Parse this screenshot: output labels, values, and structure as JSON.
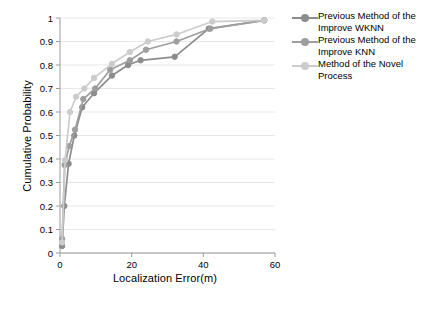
{
  "chart_data": {
    "type": "line",
    "title": "",
    "xlabel": "Localization Error(m)",
    "ylabel": "Cumulative Probability",
    "xlim": [
      0,
      60
    ],
    "ylim": [
      0,
      1
    ],
    "xticks": [
      0,
      20,
      40,
      60
    ],
    "yticks": [
      0,
      0.1,
      0.2,
      0.3,
      0.4,
      0.5,
      0.6,
      0.7,
      0.8,
      0.9,
      1
    ],
    "xtick_labels": [
      "0",
      "20",
      "40",
      "60"
    ],
    "ytick_labels": [
      "0",
      "0.1",
      "0.2",
      "0.3",
      "0.4",
      "0.5",
      "0.6",
      "0.7",
      "0.8",
      "0.9",
      "1"
    ],
    "grid": false,
    "legend_position": "right",
    "series": [
      {
        "name": "Previous Method of the Improve WKNN",
        "color": "#8c8c8c",
        "marker": "circle",
        "points": [
          {
            "x": 0.6,
            "y": 0.03
          },
          {
            "x": 1.2,
            "y": 0.2
          },
          {
            "x": 2.4,
            "y": 0.38
          },
          {
            "x": 4.0,
            "y": 0.5
          },
          {
            "x": 6.2,
            "y": 0.62
          },
          {
            "x": 9.5,
            "y": 0.68
          },
          {
            "x": 14.5,
            "y": 0.755
          },
          {
            "x": 19.0,
            "y": 0.8
          },
          {
            "x": 22.5,
            "y": 0.82
          },
          {
            "x": 32.0,
            "y": 0.835
          },
          {
            "x": 41.5,
            "y": 0.955
          },
          {
            "x": 57.0,
            "y": 0.99
          }
        ]
      },
      {
        "name": "Previous Method of the Improve KNN",
        "color": "#9e9e9e",
        "marker": "circle",
        "points": [
          {
            "x": 0.6,
            "y": 0.06
          },
          {
            "x": 1.3,
            "y": 0.375
          },
          {
            "x": 2.6,
            "y": 0.455
          },
          {
            "x": 4.2,
            "y": 0.525
          },
          {
            "x": 6.5,
            "y": 0.655
          },
          {
            "x": 9.8,
            "y": 0.7
          },
          {
            "x": 14.0,
            "y": 0.78
          },
          {
            "x": 19.5,
            "y": 0.82
          },
          {
            "x": 24.0,
            "y": 0.865
          },
          {
            "x": 32.5,
            "y": 0.9
          },
          {
            "x": 42.0,
            "y": 0.955
          },
          {
            "x": 57.0,
            "y": 0.99
          }
        ]
      },
      {
        "name": "Method of the Novel Process",
        "color": "#cccccc",
        "marker": "circle",
        "points": [
          {
            "x": 0.6,
            "y": 0.045
          },
          {
            "x": 1.4,
            "y": 0.395
          },
          {
            "x": 2.8,
            "y": 0.6
          },
          {
            "x": 4.5,
            "y": 0.665
          },
          {
            "x": 6.8,
            "y": 0.7
          },
          {
            "x": 9.5,
            "y": 0.745
          },
          {
            "x": 14.5,
            "y": 0.805
          },
          {
            "x": 19.5,
            "y": 0.855
          },
          {
            "x": 24.5,
            "y": 0.9
          },
          {
            "x": 32.5,
            "y": 0.93
          },
          {
            "x": 42.5,
            "y": 0.985
          },
          {
            "x": 57.0,
            "y": 0.99
          }
        ]
      }
    ]
  },
  "legend": {
    "entries": [
      {
        "label": "Previous Method of the Improve WKNN",
        "color": "#8c8c8c"
      },
      {
        "label": "Previous Method of the Improve KNN",
        "color": "#9e9e9e"
      },
      {
        "label": "Method of the Novel Process",
        "color": "#cccccc"
      }
    ]
  }
}
